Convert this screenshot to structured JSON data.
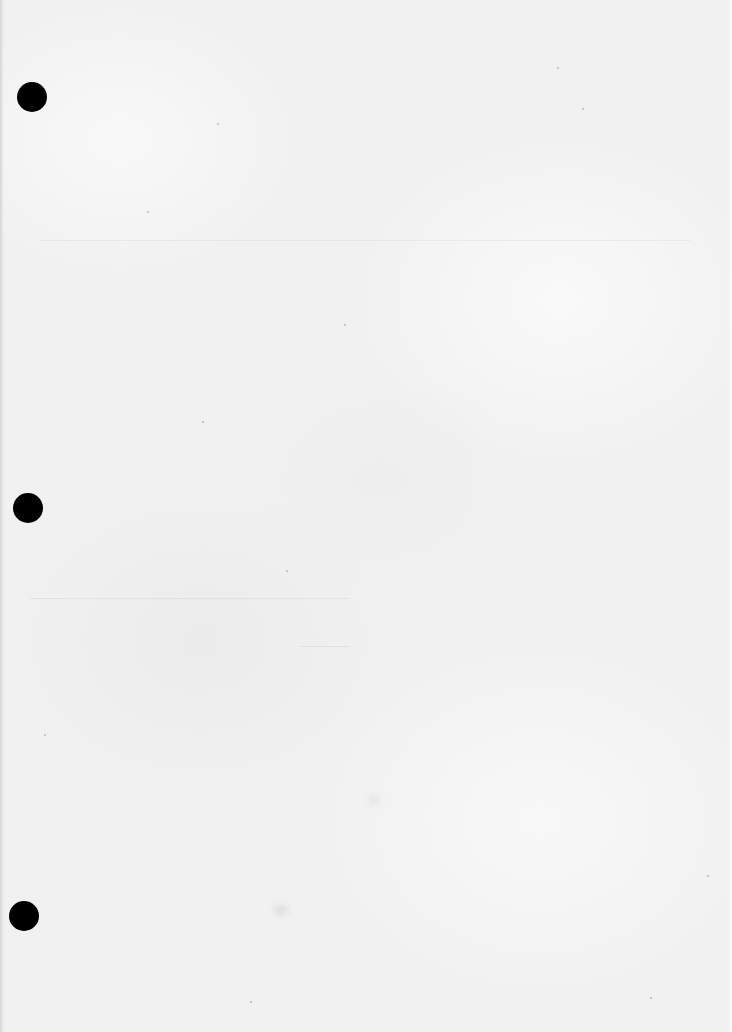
{
  "document": {
    "type": "blank-page",
    "paper_color": "#f1f1f1",
    "text_content": []
  },
  "punch_holes": [
    {
      "name": "punch-hole-top",
      "cx": 32,
      "cy": 97,
      "diameter": 30,
      "color": "#000000"
    },
    {
      "name": "punch-hole-middle",
      "cx": 28,
      "cy": 508,
      "diameter": 30,
      "color": "#000000"
    },
    {
      "name": "punch-hole-bottom",
      "cx": 24,
      "cy": 916,
      "diameter": 30,
      "color": "#000000"
    }
  ]
}
